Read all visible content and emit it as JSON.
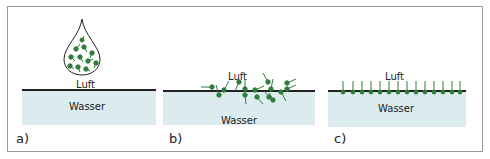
{
  "figure": {
    "panels": [
      {
        "id": "a",
        "letter": "a)",
        "air_label": "Luft",
        "water_label": "Wasser",
        "description": "droplet containing molecules above water"
      },
      {
        "id": "b",
        "letter": "b)",
        "air_label": "Luft",
        "water_label": "Wasser",
        "description": "molecules disordered at the surface"
      },
      {
        "id": "c",
        "letter": "c)",
        "air_label": "Luft",
        "water_label": "Wasser",
        "description": "molecules ordered as monolayer at surface"
      }
    ],
    "colors": {
      "molecule": "#2e7d3a",
      "water": "#dcebee",
      "surface": "#222222",
      "frame": "#9a9a9a"
    }
  }
}
